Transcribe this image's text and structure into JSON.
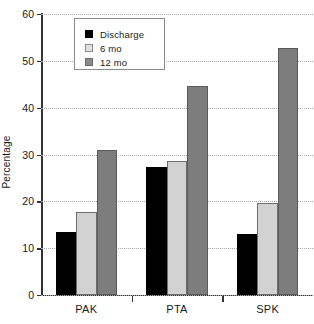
{
  "chart_data": {
    "type": "bar",
    "title": "",
    "xlabel": "",
    "ylabel": "Percentage",
    "categories": [
      "PAK",
      "PTA",
      "SPK"
    ],
    "series": [
      {
        "name": "Discharge",
        "color": "#000000",
        "values": [
          13.5,
          27.4,
          13.0
        ]
      },
      {
        "name": "6 mo",
        "color": "#d2d2d2",
        "values": [
          17.8,
          28.7,
          19.6
        ]
      },
      {
        "name": "12 mo",
        "color": "#7d7d7d",
        "values": [
          30.9,
          44.6,
          52.7
        ]
      }
    ],
    "ylim": [
      0,
      60
    ],
    "yticks": [
      0,
      10,
      20,
      30,
      40,
      50,
      60
    ],
    "ytick_labels": [
      "0",
      "10",
      "20",
      "30",
      "40",
      "50",
      "60"
    ],
    "grid": true,
    "grid_axis": "y",
    "legend_position": "upper-left",
    "legend_entries": [
      "Discharge",
      "6 mo",
      "12 mo"
    ]
  }
}
